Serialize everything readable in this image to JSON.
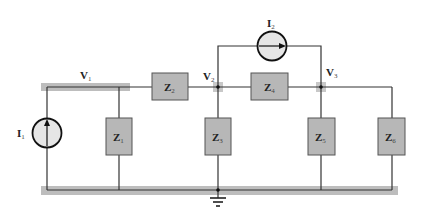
{
  "diagram": {
    "type": "circuit-schematic",
    "colors": {
      "wire": "#333333",
      "node_rail": "#bdbdbd",
      "impedance_fill": "#b7b7b7",
      "impedance_stroke": "#555555",
      "source_fill": "#e6e6e6",
      "junction_highlight": "#c8c8c8"
    },
    "nodes": [
      {
        "id": "V1",
        "label": "V",
        "sub": "1"
      },
      {
        "id": "V2",
        "label": "V",
        "sub": "2"
      },
      {
        "id": "V3",
        "label": "V",
        "sub": "3"
      },
      {
        "id": "ground",
        "label": ""
      }
    ],
    "sources": [
      {
        "id": "I1",
        "label": "I",
        "sub": "1",
        "direction": "up",
        "between": [
          "ground",
          "V1"
        ]
      },
      {
        "id": "I2",
        "label": "I",
        "sub": "2",
        "direction": "right",
        "between": [
          "V2",
          "V3"
        ]
      }
    ],
    "impedances": [
      {
        "id": "Z1",
        "label": "Z",
        "sub": "1",
        "between": [
          "V1",
          "ground"
        ]
      },
      {
        "id": "Z2",
        "label": "Z",
        "sub": "2",
        "between": [
          "V1",
          "V2"
        ]
      },
      {
        "id": "Z3",
        "label": "Z",
        "sub": "3",
        "between": [
          "V2",
          "ground"
        ]
      },
      {
        "id": "Z4",
        "label": "Z",
        "sub": "4",
        "between": [
          "V2",
          "V3"
        ]
      },
      {
        "id": "Z5",
        "label": "Z",
        "sub": "5",
        "between": [
          "V3",
          "ground"
        ]
      },
      {
        "id": "Z6",
        "label": "Z",
        "sub": "6",
        "between": [
          "V3",
          "ground"
        ]
      }
    ]
  }
}
